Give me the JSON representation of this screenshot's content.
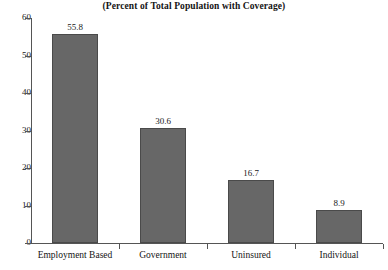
{
  "chart_data": {
    "type": "bar",
    "title": "(Percent of Total Population with Coverage)",
    "xlabel": "",
    "ylabel": "",
    "categories": [
      "Employment Based",
      "Government",
      "Uninsured",
      "Individual"
    ],
    "values": [
      55.8,
      30.6,
      16.7,
      8.9
    ],
    "value_labels": [
      "55.8",
      "30.6",
      "16.7",
      "8.9"
    ],
    "ylim": [
      0,
      60
    ],
    "yticks": [
      0,
      10,
      20,
      30,
      40,
      50,
      60
    ],
    "ytick_labels": [
      "0",
      "10",
      "20",
      "30",
      "40",
      "50",
      "60"
    ],
    "grid": false,
    "legend": false,
    "bar_color": "#676767",
    "bar_edge_color": "#4a4a4a",
    "axis_color": "#555555",
    "background": "#ffffff"
  }
}
